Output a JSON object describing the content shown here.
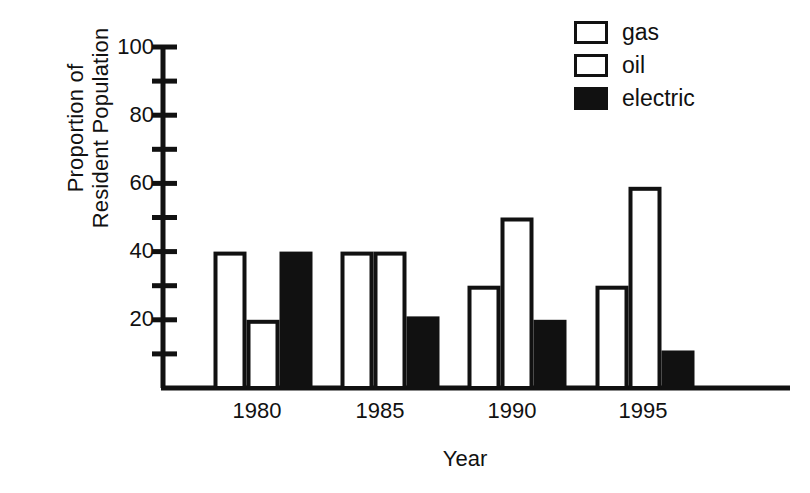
{
  "chart_data": {
    "type": "bar",
    "title": "",
    "xlabel": "Year",
    "ylabel": "Proportion of Resident Population",
    "ylabel_lines": [
      "Proportion of",
      "Resident Population"
    ],
    "categories": [
      "1980",
      "1985",
      "1990",
      "1995"
    ],
    "series": [
      {
        "name": "gas",
        "values": [
          40,
          40,
          30,
          30
        ],
        "fill": "#ffffff",
        "stroke": "#111111"
      },
      {
        "name": "oil",
        "values": [
          20,
          40,
          50,
          59
        ],
        "fill": "#ffffff",
        "stroke": "#111111"
      },
      {
        "name": "electric",
        "values": [
          40,
          21,
          20,
          11
        ],
        "fill": "#111111",
        "stroke": "#111111"
      }
    ],
    "ylim": [
      0,
      100
    ],
    "ytick_labels": [
      "100",
      "80",
      "60",
      "40",
      "20"
    ],
    "ytick_values": [
      100,
      80,
      60,
      40,
      20
    ],
    "yminor_values": [
      90,
      70,
      50,
      30,
      10
    ],
    "grid": false,
    "legend_position": "top-right",
    "legend_entries": [
      "gas",
      "oil",
      "electric"
    ],
    "axis_color": "#111111",
    "background": "#ffffff"
  },
  "legend": {
    "items": [
      {
        "label": "gas"
      },
      {
        "label": "oil"
      },
      {
        "label": "electric"
      }
    ]
  },
  "axes": {
    "y_title_line1": "Proportion of",
    "y_title_line2": "Resident Population",
    "x_title": "Year",
    "y_ticks": [
      {
        "label": "100"
      },
      {
        "label": "80"
      },
      {
        "label": "60"
      },
      {
        "label": "40"
      },
      {
        "label": "20"
      }
    ],
    "x_ticks": [
      {
        "label": "1980"
      },
      {
        "label": "1985"
      },
      {
        "label": "1990"
      },
      {
        "label": "1995"
      }
    ]
  }
}
